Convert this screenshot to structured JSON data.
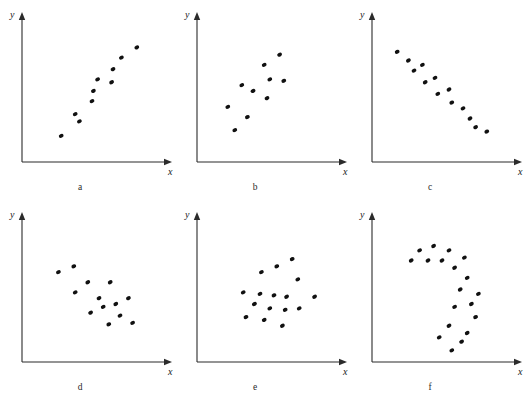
{
  "figure": {
    "background_color": "#ffffff",
    "dot_color": "#111111",
    "axis_color": "#2b2b2b",
    "axis_labels": {
      "x": "x",
      "y": "y"
    },
    "panel_width": 174,
    "panel_height": 204
  },
  "chart_data": [
    {
      "type": "scatter",
      "panel": "a",
      "caption": "a",
      "title": "",
      "xlabel": "x",
      "ylabel": "y",
      "xlim": [
        0,
        100
      ],
      "ylim": [
        0,
        100
      ],
      "grid": false,
      "legend": "none",
      "correlation": "strong positive linear",
      "points": [
        {
          "x": 28,
          "y": 18
        },
        {
          "x": 38,
          "y": 33
        },
        {
          "x": 41,
          "y": 28
        },
        {
          "x": 50,
          "y": 42
        },
        {
          "x": 51,
          "y": 49
        },
        {
          "x": 54,
          "y": 57
        },
        {
          "x": 64,
          "y": 55
        },
        {
          "x": 65,
          "y": 64
        },
        {
          "x": 71,
          "y": 72
        },
        {
          "x": 82,
          "y": 79
        }
      ]
    },
    {
      "type": "scatter",
      "panel": "b",
      "caption": "b",
      "title": "",
      "xlabel": "x",
      "ylabel": "y",
      "xlim": [
        0,
        100
      ],
      "ylim": [
        0,
        100
      ],
      "grid": false,
      "legend": "none",
      "correlation": "moderate positive linear",
      "points": [
        {
          "x": 27,
          "y": 22
        },
        {
          "x": 22,
          "y": 38
        },
        {
          "x": 36,
          "y": 31
        },
        {
          "x": 40,
          "y": 49
        },
        {
          "x": 32,
          "y": 53
        },
        {
          "x": 50,
          "y": 44
        },
        {
          "x": 52,
          "y": 57
        },
        {
          "x": 48,
          "y": 67
        },
        {
          "x": 62,
          "y": 56
        },
        {
          "x": 59,
          "y": 74
        }
      ]
    },
    {
      "type": "scatter",
      "panel": "c",
      "caption": "c",
      "title": "",
      "xlabel": "x",
      "ylabel": "y",
      "xlim": [
        0,
        100
      ],
      "ylim": [
        0,
        100
      ],
      "grid": false,
      "legend": "none",
      "correlation": "strong negative linear",
      "points": [
        {
          "x": 18,
          "y": 76
        },
        {
          "x": 26,
          "y": 70
        },
        {
          "x": 30,
          "y": 63
        },
        {
          "x": 36,
          "y": 67
        },
        {
          "x": 38,
          "y": 55
        },
        {
          "x": 45,
          "y": 58
        },
        {
          "x": 47,
          "y": 47
        },
        {
          "x": 55,
          "y": 50
        },
        {
          "x": 57,
          "y": 41
        },
        {
          "x": 65,
          "y": 37
        },
        {
          "x": 70,
          "y": 30
        },
        {
          "x": 74,
          "y": 24
        },
        {
          "x": 82,
          "y": 21
        }
      ]
    },
    {
      "type": "scatter",
      "panel": "d",
      "caption": "d",
      "title": "",
      "xlabel": "x",
      "ylabel": "y",
      "xlim": [
        0,
        100
      ],
      "ylim": [
        0,
        100
      ],
      "grid": false,
      "legend": "none",
      "correlation": "weak negative / diffuse",
      "points": [
        {
          "x": 26,
          "y": 62
        },
        {
          "x": 37,
          "y": 66
        },
        {
          "x": 47,
          "y": 55
        },
        {
          "x": 38,
          "y": 48
        },
        {
          "x": 63,
          "y": 55
        },
        {
          "x": 55,
          "y": 44
        },
        {
          "x": 67,
          "y": 40
        },
        {
          "x": 76,
          "y": 44
        },
        {
          "x": 49,
          "y": 34
        },
        {
          "x": 70,
          "y": 32
        },
        {
          "x": 62,
          "y": 26
        },
        {
          "x": 79,
          "y": 27
        },
        {
          "x": 58,
          "y": 38
        }
      ]
    },
    {
      "type": "scatter",
      "panel": "e",
      "caption": "e",
      "title": "",
      "xlabel": "x",
      "ylabel": "y",
      "xlim": [
        0,
        100
      ],
      "ylim": [
        0,
        100
      ],
      "grid": false,
      "legend": "none",
      "correlation": "no correlation (circular cloud)",
      "points": [
        {
          "x": 46,
          "y": 62
        },
        {
          "x": 57,
          "y": 66
        },
        {
          "x": 68,
          "y": 71
        },
        {
          "x": 72,
          "y": 57
        },
        {
          "x": 33,
          "y": 48
        },
        {
          "x": 45,
          "y": 47
        },
        {
          "x": 55,
          "y": 46
        },
        {
          "x": 64,
          "y": 45
        },
        {
          "x": 84,
          "y": 45
        },
        {
          "x": 41,
          "y": 40
        },
        {
          "x": 52,
          "y": 37
        },
        {
          "x": 63,
          "y": 36
        },
        {
          "x": 73,
          "y": 37
        },
        {
          "x": 35,
          "y": 31
        },
        {
          "x": 48,
          "y": 29
        },
        {
          "x": 61,
          "y": 25
        }
      ]
    },
    {
      "type": "scatter",
      "panel": "f",
      "caption": "f",
      "title": "",
      "xlabel": "x",
      "ylabel": "y",
      "xlim": [
        0,
        100
      ],
      "ylim": [
        0,
        100
      ],
      "grid": false,
      "legend": "none",
      "correlation": "non-linear (curved)",
      "points": [
        {
          "x": 34,
          "y": 77
        },
        {
          "x": 44,
          "y": 80
        },
        {
          "x": 55,
          "y": 77
        },
        {
          "x": 28,
          "y": 70
        },
        {
          "x": 40,
          "y": 70
        },
        {
          "x": 50,
          "y": 70
        },
        {
          "x": 66,
          "y": 72
        },
        {
          "x": 59,
          "y": 65
        },
        {
          "x": 68,
          "y": 58
        },
        {
          "x": 63,
          "y": 50
        },
        {
          "x": 76,
          "y": 47
        },
        {
          "x": 71,
          "y": 40
        },
        {
          "x": 59,
          "y": 38
        },
        {
          "x": 74,
          "y": 31
        },
        {
          "x": 55,
          "y": 25
        },
        {
          "x": 68,
          "y": 20
        },
        {
          "x": 48,
          "y": 17
        },
        {
          "x": 64,
          "y": 14
        },
        {
          "x": 57,
          "y": 8
        }
      ]
    }
  ]
}
